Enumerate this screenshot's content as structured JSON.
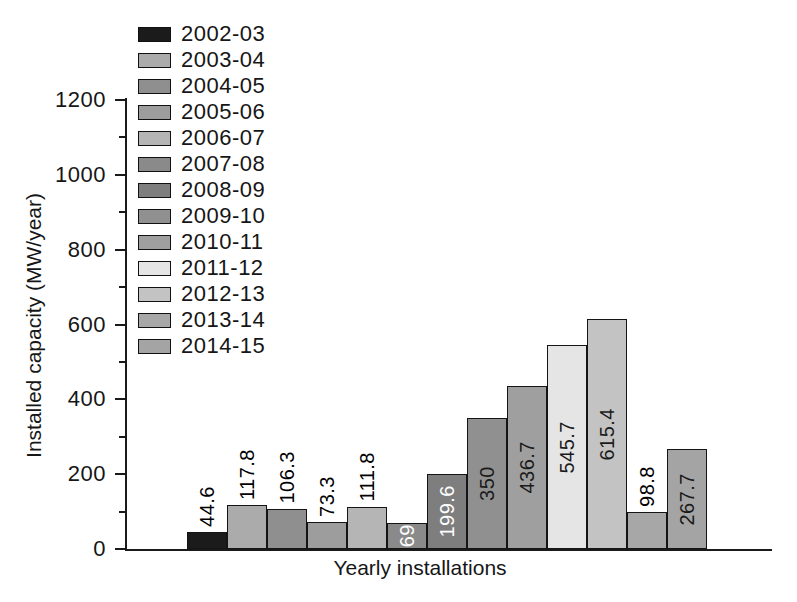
{
  "figure": {
    "xlabel": "Yearly installations",
    "ylabel": "Installed capacity (MW/year)"
  },
  "chart_data": {
    "type": "bar",
    "xlabel": "Yearly installations",
    "ylabel": "Installed capacity (MW/year)",
    "ylim": [
      0,
      1200
    ],
    "ytick_interval": 200,
    "minor_tick_interval": 100,
    "grid": false,
    "legend_position": "upper-left",
    "categories": [
      "2002-03",
      "2003-04",
      "2004-05",
      "2005-06",
      "2006-07",
      "2007-08",
      "2008-09",
      "2009-10",
      "2010-11",
      "2011-12",
      "2012-13",
      "2013-14",
      "2014-15"
    ],
    "values": [
      44.6,
      117.8,
      106.3,
      73.3,
      111.8,
      69,
      199.6,
      350,
      436.7,
      545.7,
      615.4,
      98.8,
      267.7
    ],
    "value_labels": [
      "44.6",
      "117.8",
      "106.3",
      "73.3",
      "111.8",
      "69",
      "199.6",
      "350",
      "436.7",
      "545.7",
      "615.4",
      "98.8",
      "267.7"
    ],
    "bar_colors": [
      "#1b1b1b",
      "#ababab",
      "#8f8f8f",
      "#9d9d9d",
      "#b5b5b5",
      "#8a8a8a",
      "#7e7e7e",
      "#909090",
      "#9f9f9f",
      "#e5e5e5",
      "#c3c3c3",
      "#a7a7a7",
      "#a4a4a4"
    ],
    "value_label_placement": [
      "above",
      "above",
      "above",
      "above",
      "above",
      "inside",
      "inside",
      "inside",
      "inside",
      "inside",
      "inside",
      "above",
      "inside"
    ],
    "value_label_colors": [
      "#000000",
      "#000000",
      "#000000",
      "#000000",
      "#000000",
      "#ffffff",
      "#ffffff",
      "#1a1a1a",
      "#1a1a1a",
      "#1a1a1a",
      "#1a1a1a",
      "#000000",
      "#1a1a1a"
    ],
    "axis_color": "#1a1a1a"
  }
}
